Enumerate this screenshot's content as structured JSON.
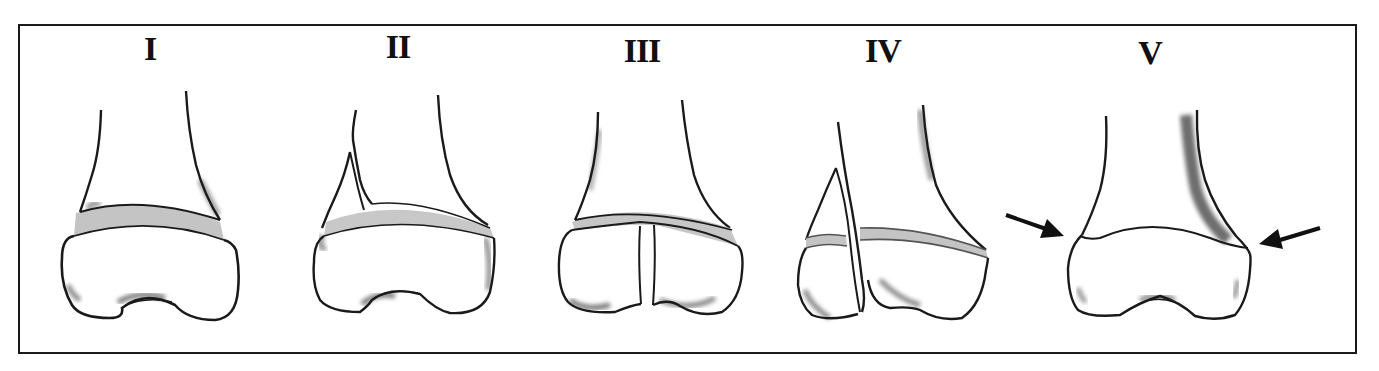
{
  "figure": {
    "panels": [
      {
        "id": "type-1",
        "label": "I"
      },
      {
        "id": "type-2",
        "label": "II"
      },
      {
        "id": "type-3",
        "label": "III"
      },
      {
        "id": "type-4",
        "label": "IV"
      },
      {
        "id": "type-5",
        "label": "V"
      }
    ],
    "colors": {
      "outline": "#1a1a1a",
      "physis": "#bdbdbd",
      "shading": "#8a8a8a",
      "background": "#ffffff"
    },
    "arrows": {
      "panel": "V",
      "count": 2,
      "direction": "pointing inward at physis"
    }
  }
}
